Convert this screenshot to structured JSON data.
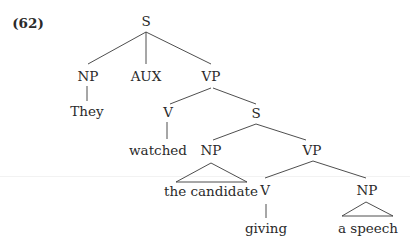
{
  "example_number": "(62)",
  "tree": {
    "nodes": [
      {
        "id": "s_root",
        "label": "S",
        "x": 146,
        "y": 22
      },
      {
        "id": "np_subj",
        "label": "NP",
        "x": 88,
        "y": 77
      },
      {
        "id": "they",
        "label": "They",
        "x": 87,
        "y": 112
      },
      {
        "id": "aux",
        "label": "AUX",
        "x": 146,
        "y": 77
      },
      {
        "id": "vp_main",
        "label": "VP",
        "x": 211,
        "y": 77
      },
      {
        "id": "v_main",
        "label": "V",
        "x": 168,
        "y": 112
      },
      {
        "id": "watched",
        "label": "watched",
        "x": 158,
        "y": 150
      },
      {
        "id": "s_embed",
        "label": "S",
        "x": 256,
        "y": 114
      },
      {
        "id": "np_obj",
        "label": "NP",
        "x": 211,
        "y": 150
      },
      {
        "id": "the_candidate",
        "label": "the candidate",
        "x": 211,
        "y": 192
      },
      {
        "id": "vp_embed",
        "label": "VP",
        "x": 310,
        "y": 150
      },
      {
        "id": "v_embed",
        "label": "V",
        "x": 265,
        "y": 191
      },
      {
        "id": "giving",
        "label": "giving",
        "x": 266,
        "y": 228
      },
      {
        "id": "np_embed",
        "label": "NP",
        "x": 370,
        "y": 191
      },
      {
        "id": "a_speech",
        "label": "a speech",
        "x": 370,
        "y": 228
      }
    ],
    "edges": [
      [
        "s_root",
        "np_subj"
      ],
      [
        "s_root",
        "aux"
      ],
      [
        "s_root",
        "vp_main"
      ],
      [
        "np_subj",
        "they"
      ],
      [
        "vp_main",
        "v_main"
      ],
      [
        "vp_main",
        "s_embed"
      ],
      [
        "v_main",
        "watched"
      ],
      [
        "s_embed",
        "np_obj"
      ],
      [
        "s_embed",
        "vp_embed"
      ],
      [
        "vp_embed",
        "v_embed"
      ],
      [
        "vp_embed",
        "np_embed"
      ],
      [
        "v_embed",
        "giving"
      ]
    ],
    "triangles": [
      {
        "parent": "np_obj",
        "child": "the_candidate"
      },
      {
        "parent": "np_embed",
        "child": "a_speech"
      }
    ]
  },
  "colors": {
    "line": "#3a3a3a",
    "text": "#2a2a2a"
  }
}
